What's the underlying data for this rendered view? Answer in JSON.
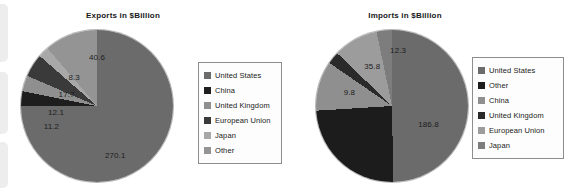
{
  "document": {
    "background": "#ffffff"
  },
  "chart_data": [
    {
      "type": "pie",
      "title": "Exports in $Billion",
      "position": "left",
      "units": "$Billion",
      "categories": [
        "United States",
        "China",
        "United Kingdom",
        "European Union",
        "Japan",
        "Other"
      ],
      "values": [
        270.1,
        11.2,
        12.1,
        17.7,
        8.3,
        40.6
      ],
      "labels": [
        "270.1",
        "11.2",
        "12.1",
        "17.7",
        "8.3",
        "40.6"
      ],
      "colors": [
        "#6b6b6b",
        "#1e1e1e",
        "#8f8f8f",
        "#3a3a3a",
        "#a8a8a8",
        "#949494"
      ],
      "legend_position": "right",
      "legend": [
        {
          "label": "United States",
          "color": "#6b6b6b"
        },
        {
          "label": "China",
          "color": "#1e1e1e"
        },
        {
          "label": "United Kingdom",
          "color": "#8f8f8f"
        },
        {
          "label": "European Union",
          "color": "#3a3a3a"
        },
        {
          "label": "Japan",
          "color": "#a8a8a8"
        },
        {
          "label": "Other",
          "color": "#949494"
        }
      ],
      "slice_labels": [
        {
          "text": "40.6",
          "x": 50,
          "y": 18
        },
        {
          "text": "8.3",
          "x": 35,
          "y": 31
        },
        {
          "text": "17.7",
          "x": 30,
          "y": 42
        },
        {
          "text": "12.1",
          "x": 23,
          "y": 54
        },
        {
          "text": "11.2",
          "x": 20,
          "y": 63
        },
        {
          "text": "270.1",
          "x": 62,
          "y": 82
        }
      ]
    },
    {
      "type": "pie",
      "title": "Imports in $Billion",
      "position": "right",
      "units": "$Billion",
      "categories": [
        "United States",
        "Other",
        "China",
        "United Kingdom",
        "European Union",
        "Japan"
      ],
      "values": [
        186.8,
        91.2,
        39.7,
        9.8,
        35.8,
        12.3
      ],
      "labels": [
        "186.8",
        "91.2",
        "39.7",
        "9.8",
        "35.8",
        "12.3"
      ],
      "colors": [
        "#6b6b6b",
        "#1c1c1c",
        "#8f8f8f",
        "#2a2a2a",
        "#9c9c9c",
        "#7d7d7d"
      ],
      "legend_position": "right",
      "legend": [
        {
          "label": "United States",
          "color": "#6b6b6b"
        },
        {
          "label": "Other",
          "color": "#1c1c1c"
        },
        {
          "label": "China",
          "color": "#8f8f8f"
        },
        {
          "label": "United Kingdom",
          "color": "#2a2a2a"
        },
        {
          "label": "European Union",
          "color": "#9c9c9c"
        },
        {
          "label": "Japan",
          "color": "#7d7d7d"
        }
      ],
      "slice_labels": [
        {
          "text": "12.3",
          "x": 54,
          "y": 13
        },
        {
          "text": "35.8",
          "x": 37,
          "y": 24
        },
        {
          "text": "9.8",
          "x": 22,
          "y": 41
        },
        {
          "text": "39.7",
          "x": 15,
          "y": 58
        },
        {
          "text": "91.2",
          "x": 38,
          "y": 85
        },
        {
          "text": "186.8",
          "x": 74,
          "y": 62
        }
      ]
    }
  ]
}
